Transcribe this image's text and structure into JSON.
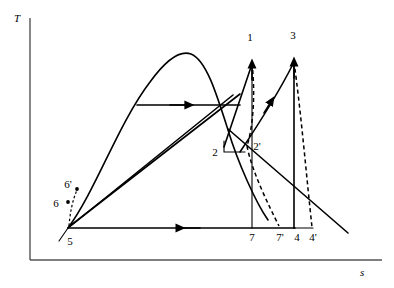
{
  "figure": {
    "type": "thermodynamic-ts-diagram",
    "title": "",
    "background_color": "#ffffff",
    "line_color": "#000000",
    "axis_color": "#555555"
  },
  "axes": {
    "y_label": "T",
    "x_label": "s",
    "y_label_pos": {
      "x": 14,
      "y": 22
    },
    "x_label_pos": {
      "x": 360,
      "y": 276
    },
    "origin": {
      "x": 30,
      "y": 260
    },
    "y_top": 18,
    "x_right": 382
  },
  "state_points": [
    {
      "id": "1",
      "label": "1",
      "x": 252,
      "y": 62,
      "label_x": 250,
      "label_y": 41
    },
    {
      "id": "2",
      "label": "2",
      "x": 224,
      "y": 148,
      "label_x": 214,
      "label_y": 155
    },
    {
      "id": "2p",
      "label": "2'",
      "x": 248,
      "y": 148,
      "label_x": 253,
      "label_y": 149
    },
    {
      "id": "3",
      "label": "3",
      "x": 294,
      "y": 60,
      "label_x": 292,
      "label_y": 39
    },
    {
      "id": "4",
      "label": "4",
      "x": 294,
      "y": 228,
      "label_x": 296,
      "label_y": 241
    },
    {
      "id": "4p",
      "label": "4'",
      "x": 312,
      "y": 228,
      "label_x": 311,
      "label_y": 241
    },
    {
      "id": "5",
      "label": "5",
      "x": 68,
      "y": 228,
      "label_x": 68,
      "label_y": 244
    },
    {
      "id": "6",
      "label": "6",
      "x": 68,
      "y": 202,
      "label_x": 54,
      "label_y": 208
    },
    {
      "id": "6p",
      "label": "6'",
      "x": 76,
      "y": 188,
      "label_x": 64,
      "label_y": 189
    },
    {
      "id": "7",
      "label": "7",
      "x": 252,
      "y": 228,
      "label_x": 250,
      "label_y": 241
    },
    {
      "id": "7p",
      "label": "7'",
      "x": 280,
      "y": 228,
      "label_x": 278,
      "label_y": 241
    }
  ],
  "curves": {
    "saturation_dome": {
      "name": "saturation-dome",
      "path": "M 68 228 C 96 190 120 120 150 80 C 166 58 180 50 190 54 C 206 60 216 92 228 130 C 240 168 258 206 268 222 C 290 258 330 268 352 240"
    },
    "isobar_horizontal": {
      "name": "constant-pressure-line",
      "from": {
        "x": 137,
        "y": 105
      },
      "to": {
        "x": 240,
        "y": 105
      },
      "arrow_at": {
        "x": 186,
        "y": 105
      },
      "arrow_dir": "right"
    },
    "bottom_return": {
      "name": "condensation-line",
      "from": {
        "x": 294,
        "y": 228
      },
      "to": {
        "x": 68,
        "y": 228
      },
      "arrow_at": {
        "x": 182,
        "y": 228
      },
      "arrow_dir": "left"
    },
    "expansion_1_to_2": {
      "name": "turbine-expansion-ideal",
      "path": "M 252 62 L 224 148"
    },
    "expansion_1_to_2p_dashed": {
      "name": "turbine-expansion-actual",
      "path": "M 252 62 C 254 96 250 128 246 146"
    },
    "reheat_2p_to_3": {
      "name": "reheat-line",
      "path": "M 238 152 C 254 130 276 96 292 66",
      "arrow_at": {
        "x": 270,
        "y": 104
      }
    },
    "expansion_3_to_4": {
      "name": "lp-turbine-ideal",
      "from": {
        "x": 294,
        "y": 60
      },
      "to": {
        "x": 294,
        "y": 228
      }
    },
    "expansion_3_to_4p_dashed": {
      "name": "lp-turbine-actual",
      "path": "M 294 60 C 300 110 306 180 311 226"
    },
    "expansion_1_to_7_vertical": {
      "name": "isentropic-drop-to-7",
      "from": {
        "x": 252,
        "y": 62
      },
      "to": {
        "x": 252,
        "y": 228
      }
    },
    "dashed_to_7p": {
      "name": "actual-drop-to-7p",
      "path": "M 247 143 C 252 170 268 205 279 226"
    },
    "pump_5_to_6": {
      "name": "pump-line-ideal",
      "path": "M 68 228 L 231 96"
    },
    "pump_5_to_6p": {
      "name": "pump-line-actual",
      "path": "M 68 228 L 238 96"
    },
    "dashed_6_to_6p": {
      "name": "pump-irreversibility",
      "path": "M 68 224 C 70 210 73 198 77 189"
    },
    "tick_5_down": {
      "name": "tick-below-5",
      "from": {
        "x": 68,
        "y": 228
      },
      "to": {
        "x": 60,
        "y": 240
      }
    },
    "small_box_at_2": {
      "name": "state-2-marker-box",
      "path": "M 224 140 L 224 152 L 244 152"
    },
    "desc_right_line": {
      "name": "descending-line",
      "path": "M 228 130 L 346 232"
    }
  },
  "arrows": [
    {
      "name": "arrow-isobar-right",
      "x": 186,
      "y": 105,
      "dir": "right"
    },
    {
      "name": "arrow-bottom-left",
      "x": 182,
      "y": 228,
      "dir": "left"
    },
    {
      "name": "arrow-reheat-up",
      "x": 270,
      "y": 104,
      "dir": "up-right"
    },
    {
      "name": "arrow-to-1",
      "x": 252,
      "y": 62,
      "dir": "up"
    },
    {
      "name": "arrow-to-3",
      "x": 294,
      "y": 60,
      "dir": "up"
    }
  ]
}
